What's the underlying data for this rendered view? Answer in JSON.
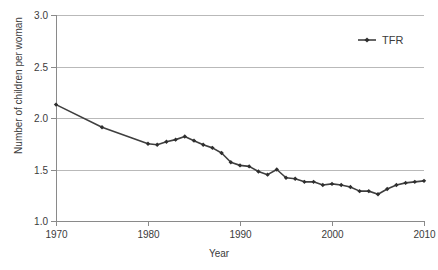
{
  "chart_data": {
    "type": "line",
    "title": "",
    "xlabel": "Year",
    "ylabel": "Number of children per woman",
    "xlim": [
      1970,
      2010
    ],
    "ylim": [
      1.0,
      3.0
    ],
    "xticks": [
      1970,
      1980,
      1990,
      2000,
      2010
    ],
    "yticks": [
      "1.0",
      "1.5",
      "2.0",
      "2.5",
      "3.0"
    ],
    "grid": "horizontal",
    "legend_position": "top-right",
    "series": [
      {
        "name": "TFR",
        "marker": "diamond",
        "color": "#3f3f3f",
        "x": [
          1970,
          1975,
          1980,
          1981,
          1982,
          1983,
          1984,
          1985,
          1986,
          1987,
          1988,
          1989,
          1990,
          1991,
          1992,
          1993,
          1994,
          1995,
          1996,
          1997,
          1998,
          1999,
          2000,
          2001,
          2002,
          2003,
          2004,
          2005,
          2006,
          2007,
          2008,
          2009,
          2010
        ],
        "values": [
          2.13,
          1.91,
          1.75,
          1.74,
          1.77,
          1.79,
          1.82,
          1.78,
          1.74,
          1.71,
          1.66,
          1.57,
          1.54,
          1.53,
          1.48,
          1.45,
          1.5,
          1.42,
          1.41,
          1.38,
          1.38,
          1.35,
          1.36,
          1.35,
          1.33,
          1.29,
          1.29,
          1.26,
          1.31,
          1.35,
          1.37,
          1.38,
          1.39
        ]
      }
    ]
  },
  "legend": {
    "entries": [
      {
        "label": "TFR"
      }
    ]
  },
  "axes": {
    "y_title": "Number of children per woman",
    "x_title": "Year"
  }
}
